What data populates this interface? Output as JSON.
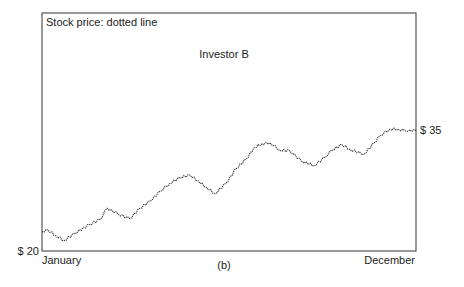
{
  "chart_data": {
    "type": "line",
    "title": "Investor B",
    "legend_note": "Stock price: dotted line",
    "caption": "(b)",
    "xlabel": "",
    "ylabel": "",
    "x_tick_labels": [
      "January",
      "December"
    ],
    "y_tick_labels": [
      "$ 20",
      "$ 35"
    ],
    "ylim": [
      20,
      35
    ],
    "xlim": [
      0,
      1
    ],
    "grid": false,
    "series": [
      {
        "name": "Stock price",
        "style": "dotted",
        "x": [
          0,
          0.016,
          0.037,
          0.059,
          0.088,
          0.128,
          0.155,
          0.174,
          0.203,
          0.235,
          0.262,
          0.289,
          0.316,
          0.342,
          0.369,
          0.396,
          0.417,
          0.439,
          0.463,
          0.492,
          0.519,
          0.546,
          0.567,
          0.588,
          0.61,
          0.636,
          0.663,
          0.695,
          0.728,
          0.756,
          0.775,
          0.802,
          0.823,
          0.861,
          0.888,
          0.904,
          0.93,
          0.952,
          0.971,
          0.984,
          1.0
        ],
        "values": [
          22.4,
          22.6,
          21.9,
          21.3,
          22.2,
          23.3,
          23.9,
          25.3,
          24.6,
          24.0,
          25.3,
          26.2,
          27.4,
          28.4,
          29.1,
          29.4,
          28.7,
          27.9,
          27.1,
          28.4,
          30.2,
          31.4,
          32.8,
          33.3,
          33.4,
          32.5,
          32.4,
          31.1,
          30.6,
          31.6,
          32.5,
          33.2,
          32.6,
          32.0,
          33.4,
          34.3,
          35.1,
          35.1,
          34.9,
          35.0,
          34.9
        ]
      }
    ]
  }
}
